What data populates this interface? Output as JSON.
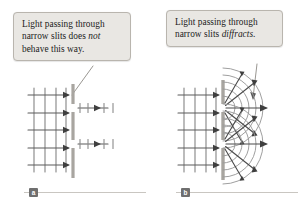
{
  "figure": {
    "background_color": "#ffffff",
    "width": 305,
    "height": 211
  },
  "panels": [
    {
      "id": "a",
      "badge_label": "a",
      "caption_line1": "Light passing through",
      "caption_line2_pre": "narrow slits does ",
      "caption_line2_em": "not",
      "caption_line3": "behave this way.",
      "caption_plain": "Light passing through narrow slits does not behave this way.",
      "diagram": {
        "description": "Plane wavefronts approach a barrier with two narrow slits; light continues as two narrow straight beams without spreading.",
        "incoming_wavefronts": 4,
        "incoming_arrows": 5,
        "slits": 2,
        "outgoing_beams": 2,
        "outgoing_beam_type": "straight",
        "diffraction": false
      }
    },
    {
      "id": "b",
      "badge_label": "b",
      "caption_line1": "Light passing through",
      "caption_line2_pre": "narrow slits ",
      "caption_line2_em": "diffracts",
      "caption_line3": ".",
      "caption_plain": "Light passing through narrow slits diffracts.",
      "diagram": {
        "description": "Plane wavefronts approach a barrier with two narrow slits; light spreads as circular wavefronts radiating from each slit.",
        "incoming_wavefronts": 4,
        "incoming_arrows": 5,
        "slits": 2,
        "outgoing_wavefront_type": "circular",
        "outgoing_arcs_per_slit": 5,
        "radial_arrows_per_slit": 5,
        "diffraction": true
      }
    }
  ],
  "colors": {
    "caption_fill": "#e9e7e3",
    "caption_border": "#b9b5ae",
    "text": "#1b1b1b",
    "badge_fill": "#6f6f6f",
    "badge_text": "#ffffff",
    "rule": "#c9c6c1",
    "wave_line": "#7d7d7d",
    "arrow": "#4a4a4a",
    "barrier": "#a8a5a0",
    "leader_line": "#8d8a85"
  }
}
